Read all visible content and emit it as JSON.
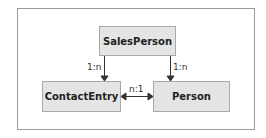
{
  "diagram": {
    "nodes": [
      {
        "id": "salesperson",
        "label": "SalesPerson"
      },
      {
        "id": "contactentry",
        "label": "ContactEntry"
      },
      {
        "id": "person",
        "label": "Person"
      }
    ],
    "edges": [
      {
        "from": "SalesPerson",
        "to": "ContactEntry",
        "label": "1:n"
      },
      {
        "from": "SalesPerson",
        "to": "Person",
        "label": "1:n"
      },
      {
        "from": "ContactEntry",
        "to": "Person",
        "label": "n:1",
        "bidirectional": true
      }
    ]
  }
}
